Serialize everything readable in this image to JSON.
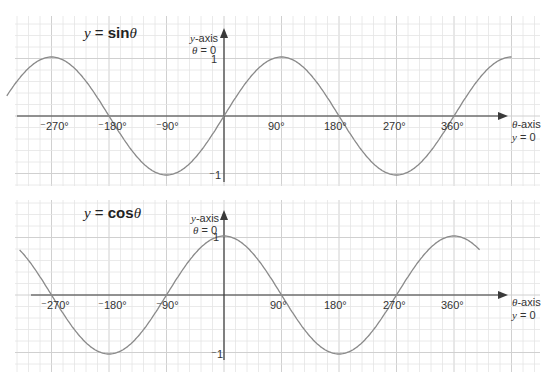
{
  "chart_data": [
    {
      "type": "line",
      "title": "y = sinθ",
      "function": "sin",
      "xlabel": "θ-axis",
      "xlabel_note": "y = 0",
      "ylabel": "y-axis",
      "ylabel_note": "θ = 0",
      "x_ticks": [
        "⁻270°",
        "⁻180°",
        "⁻90°",
        "90°",
        "180°",
        "270°",
        "360°"
      ],
      "x_tick_values": [
        -270,
        -180,
        -90,
        90,
        180,
        270,
        360
      ],
      "y_ticks": [
        "1",
        "⁻1"
      ],
      "y_tick_values": [
        1,
        -1
      ],
      "xlim": [
        -340,
        450
      ],
      "ylim": [
        -1,
        1
      ],
      "grid": true,
      "x": [
        -340,
        -270,
        -180,
        -90,
        0,
        90,
        180,
        270,
        360,
        450
      ],
      "values": [
        0.34,
        1,
        0,
        -1,
        0,
        1,
        0,
        -1,
        0,
        1
      ]
    },
    {
      "type": "line",
      "title": "y = cosθ",
      "function": "cos",
      "xlabel": "θ-axis",
      "xlabel_note": "y = 0",
      "ylabel": "y-axis",
      "ylabel_note": "θ = 0",
      "x_ticks": [
        "⁻270°",
        "⁻180°",
        "⁻90°",
        "90°",
        "180°",
        "270°",
        "360°"
      ],
      "x_tick_values": [
        -270,
        -180,
        -90,
        90,
        180,
        270,
        360
      ],
      "y_ticks": [
        "1",
        "⁻1"
      ],
      "y_tick_values": [
        1,
        -1
      ],
      "xlim": [
        -320,
        400
      ],
      "ylim": [
        -1,
        1
      ],
      "grid": true,
      "x": [
        -320,
        -270,
        -180,
        -90,
        0,
        90,
        180,
        270,
        360,
        400
      ],
      "values": [
        0.77,
        0,
        -1,
        0,
        1,
        0,
        -1,
        0,
        1,
        0.77
      ]
    }
  ],
  "charts": {
    "sin": {
      "title_prefix": "y",
      "title_eq": " = ",
      "title_fn": "sin",
      "title_var": "θ",
      "y_axis_label": "y",
      "y_axis_label_rest": "-axis",
      "y_axis_note_var": "θ",
      "y_axis_note_rest": " = 0",
      "x_axis_label_var": "θ",
      "x_axis_label_rest": "-axis",
      "x_axis_note_var": "y",
      "x_axis_note_rest": " = 0",
      "y_tick_top": "1",
      "y_tick_bottom": "⁻1",
      "ticks": [
        "⁻270°",
        "⁻180°",
        "⁻90°",
        "90°",
        "180°",
        "270°",
        "360°"
      ]
    },
    "cos": {
      "title_prefix": "y",
      "title_eq": " = ",
      "title_fn": "cos",
      "title_var": "θ",
      "y_axis_label": "y",
      "y_axis_label_rest": "-axis",
      "y_axis_note_var": "θ",
      "y_axis_note_rest": " = 0",
      "x_axis_label_var": "θ",
      "x_axis_label_rest": "-axis",
      "x_axis_note_var": "y",
      "x_axis_note_rest": " = 0",
      "y_tick_top": "1",
      "y_tick_bottom": "⁻1",
      "ticks": [
        "⁻270°",
        "⁻180°",
        "⁻90°",
        "90°",
        "180°",
        "270°",
        "360°"
      ]
    }
  },
  "colors": {
    "curve": "#8a8a8a",
    "axis": "#3a3a3a",
    "grid_major": "#d0d0d0",
    "grid_minor": "#e4e4e4"
  }
}
